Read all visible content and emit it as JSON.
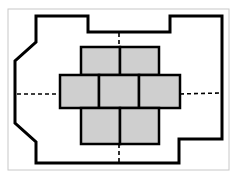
{
  "diagram": {
    "title": "",
    "colors": {
      "background": "#ffffff",
      "frame": "#c8c8c8",
      "outline": "#000000",
      "tile_fill": "#cfcfcf",
      "tile_stroke": "#000000"
    },
    "frame": {
      "x": 8,
      "y": 9,
      "w": 221,
      "h": 161
    },
    "outline_points": "36,16 88,16 88,32 170,32 170,16 222,16 222,139 179,139 179,163 36,163 36,142 15,123 15,61 36,42",
    "tiles": [
      {
        "row": "top",
        "x": 81,
        "y": 47,
        "w": 39,
        "h": 28
      },
      {
        "row": "top",
        "x": 120,
        "y": 47,
        "w": 39,
        "h": 28
      },
      {
        "row": "middle",
        "x": 60,
        "y": 75,
        "w": 39,
        "h": 33
      },
      {
        "row": "middle",
        "x": 99,
        "y": 75,
        "w": 40,
        "h": 33
      },
      {
        "row": "middle",
        "x": 139,
        "y": 75,
        "w": 41,
        "h": 33
      },
      {
        "row": "bottom",
        "x": 81,
        "y": 108,
        "w": 39,
        "h": 36
      },
      {
        "row": "bottom",
        "x": 120,
        "y": 108,
        "w": 39,
        "h": 36
      }
    ],
    "dashed_axes": [
      {
        "x1": 119,
        "y1": 33,
        "x2": 119,
        "y2": 47
      },
      {
        "x1": 119,
        "y1": 144,
        "x2": 119,
        "y2": 162
      },
      {
        "x1": 17,
        "y1": 94,
        "x2": 60,
        "y2": 94
      },
      {
        "x1": 180,
        "y1": 94,
        "x2": 220,
        "y2": 93
      }
    ]
  }
}
